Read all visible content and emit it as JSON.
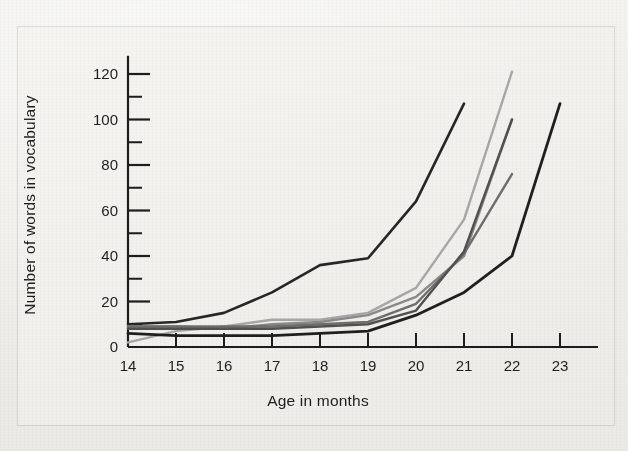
{
  "figure": {
    "kind": "scanned-textbook-line-graph",
    "background_color": "#f1f0ec",
    "ink_color": "#1d1d1d"
  },
  "axes": {
    "x_axis_label": "Age in months",
    "y_axis_label": "Number of words in vocabulary",
    "x_tick_labels": [
      "14",
      "15",
      "16",
      "17",
      "18",
      "19",
      "20",
      "21",
      "22",
      "23"
    ],
    "y_tick_labels": [
      "0",
      "20",
      "40",
      "60",
      "80",
      "100",
      "120"
    ]
  },
  "chart_data": {
    "type": "line",
    "title": "",
    "subtitle": "",
    "xlabel": "Age in months",
    "ylabel": "Number of words in vocabulary",
    "xlim": [
      14,
      23.6
    ],
    "ylim": [
      0,
      128
    ],
    "xticks": [
      14,
      15,
      16,
      17,
      18,
      19,
      20,
      21,
      22,
      23
    ],
    "yticks": [
      0,
      20,
      40,
      60,
      80,
      100,
      120
    ],
    "y_minor_ticks": [
      10,
      30,
      50,
      70,
      90,
      110
    ],
    "grid": false,
    "legend": false,
    "legend_position": "none",
    "annotations": [],
    "series": [
      {
        "name": "child-1",
        "color": "#262626",
        "width": 2.6,
        "x": [
          14,
          15,
          16,
          17,
          18,
          19,
          20,
          21
        ],
        "values": [
          10,
          11,
          15,
          24,
          36,
          39,
          64,
          107
        ]
      },
      {
        "name": "child-2",
        "color": "#a7a7a7",
        "width": 2.4,
        "x": [
          14,
          15,
          16,
          17,
          18,
          19,
          20,
          21,
          22
        ],
        "values": [
          2,
          7,
          9,
          12,
          12,
          15,
          26,
          56,
          121
        ]
      },
      {
        "name": "child-3",
        "color": "#8a8a8a",
        "width": 2.4,
        "x": [
          14,
          15,
          16,
          17,
          18,
          19,
          20,
          21,
          22
        ],
        "values": [
          9,
          9,
          8,
          10,
          11,
          14,
          22,
          40,
          100
        ]
      },
      {
        "name": "child-4",
        "color": "#6e6e6e",
        "width": 2.4,
        "x": [
          14,
          15,
          16,
          17,
          18,
          19,
          20,
          21,
          22
        ],
        "values": [
          9,
          9,
          9,
          9,
          10,
          11,
          19,
          41,
          76
        ]
      },
      {
        "name": "child-5",
        "color": "#515151",
        "width": 2.4,
        "x": [
          14,
          15,
          16,
          17,
          18,
          19,
          20,
          21,
          22
        ],
        "values": [
          8,
          8,
          8,
          8,
          9,
          10,
          16,
          42,
          100
        ]
      },
      {
        "name": "child-6",
        "color": "#1f1f1f",
        "width": 2.8,
        "x": [
          14,
          15,
          16,
          17,
          18,
          19,
          20,
          21,
          22,
          23
        ],
        "values": [
          6,
          5,
          5,
          5,
          6,
          7,
          14,
          24,
          40,
          107
        ]
      }
    ]
  }
}
